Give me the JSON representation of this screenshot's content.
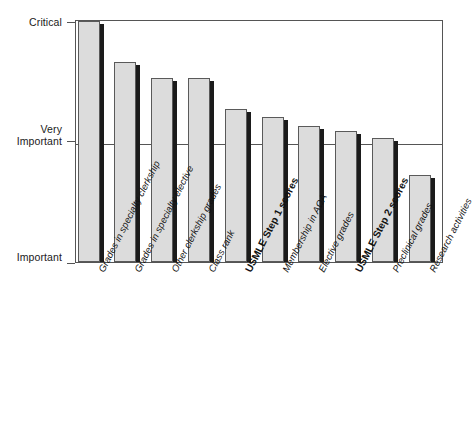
{
  "chart_data": {
    "type": "bar",
    "title": "",
    "subtitle": "",
    "xlabel": "",
    "ylabel": "",
    "grid": true,
    "legend": "none",
    "orientation": "vertical",
    "ylim": [
      1,
      3
    ],
    "ytick_values": [
      3,
      2,
      1
    ],
    "ytick_labels": [
      "Critical",
      "Very\nImportant",
      "Important"
    ],
    "categories": [
      "Grades in specialty clerkship",
      "Grades in specialty elective",
      "Other clerkship grades",
      "Class rank",
      "USMLE Step 1 scores",
      "Membership in AΩA",
      "Elective grades",
      "USMLE Step 2 scores",
      "Preclinical grades",
      "Research activities"
    ],
    "category_emphasis": [
      "normal",
      "normal",
      "normal",
      "normal",
      "bold",
      "normal",
      "normal",
      "bold",
      "normal",
      "normal"
    ],
    "values": [
      3.0,
      2.66,
      2.53,
      2.53,
      2.27,
      2.2,
      2.13,
      2.09,
      2.03,
      1.72
    ],
    "bar_fill_color": "#dcdcdc",
    "bar_edge_color": "#5a5a5a",
    "bar_shadow_color": "#1b1b1b",
    "axis_color": "#555555",
    "background_color": "#ffffff",
    "text_color": "#111111"
  },
  "axis": {
    "y_ticks": [
      {
        "label": "Critical",
        "value": 3
      },
      {
        "label": "Very\nImportant",
        "value": 2
      },
      {
        "label": "Important",
        "value": 1
      }
    ]
  }
}
